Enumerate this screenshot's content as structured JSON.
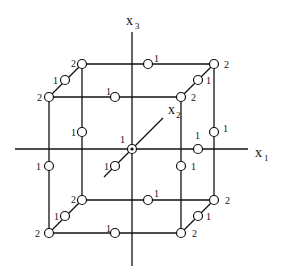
{
  "figure": {
    "axes": {
      "x1": {
        "label": "x",
        "sub": "1"
      },
      "x2": {
        "label": "x",
        "sub": "2"
      },
      "x3": {
        "label": "x",
        "sub": "3"
      }
    },
    "point_labels": {
      "corner": "2",
      "edge": "1",
      "center": "1"
    },
    "colors": {
      "line": "#111111",
      "background": "#ffffff"
    }
  }
}
